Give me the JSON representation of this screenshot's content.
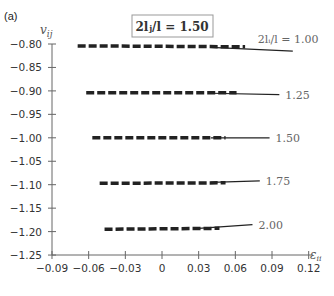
{
  "panel_label": "(a)",
  "header_box": {
    "text": "2lⱼ/l = 1.50"
  },
  "chart_data": {
    "type": "line",
    "xlabel": "ε_ii",
    "ylabel": "v_ij",
    "xlim": [
      -0.09,
      0.12
    ],
    "ylim": [
      -1.25,
      -0.8
    ],
    "xticks": [
      "-0.09",
      "-0.06",
      "-0.03",
      "0",
      "0.03",
      "0.06",
      "0.09",
      "0.12"
    ],
    "yticks": [
      "-0.80",
      "-0.85",
      "-0.90",
      "-0.95",
      "-1.00",
      "-1.05",
      "-1.10",
      "-1.15",
      "-1.20",
      "-1.25"
    ],
    "grid": false,
    "legend_position": "inline-labels",
    "series": [
      {
        "name": "2l_i/l = 1.00",
        "label": "2lᵢ/l = 1.00",
        "dashed": {
          "x": [
            -0.069,
            0.068
          ],
          "y": [
            -0.804,
            -0.806
          ]
        },
        "solid": {
          "x": [
            0.04,
            0.107
          ],
          "y": [
            -0.807,
            -0.815
          ]
        }
      },
      {
        "name": "1.25",
        "label": "1.25",
        "dashed": {
          "x": [
            -0.062,
            0.061
          ],
          "y": [
            -0.904,
            -0.904
          ]
        },
        "solid": {
          "x": [
            0.04,
            0.096
          ],
          "y": [
            -0.905,
            -0.908
          ]
        }
      },
      {
        "name": "1.50",
        "label": "1.50",
        "dashed": {
          "x": [
            -0.057,
            0.052
          ],
          "y": [
            -1.0,
            -1.0
          ]
        },
        "solid": {
          "x": [
            0.04,
            0.088
          ],
          "y": [
            -1.0,
            -1.0
          ]
        }
      },
      {
        "name": "1.75",
        "label": "1.75",
        "dashed": {
          "x": [
            -0.051,
            0.052
          ],
          "y": [
            -1.097,
            -1.096
          ]
        },
        "solid": {
          "x": [
            0.04,
            0.08
          ],
          "y": [
            -1.095,
            -1.092
          ]
        }
      },
      {
        "name": "2.00",
        "label": "2.00",
        "dashed": {
          "x": [
            -0.047,
            0.047
          ],
          "y": [
            -1.195,
            -1.193
          ]
        },
        "solid": {
          "x": [
            0.03,
            0.074
          ],
          "y": [
            -1.193,
            -1.185
          ]
        }
      }
    ]
  }
}
